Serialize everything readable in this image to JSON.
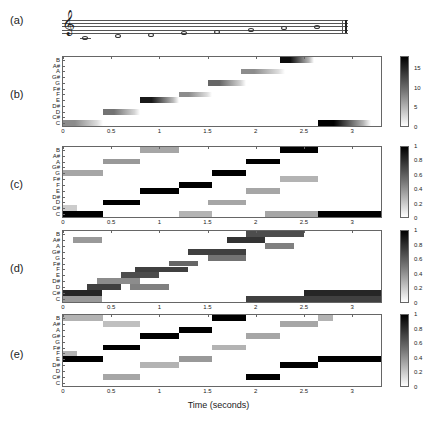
{
  "panel_labels": [
    "(a)",
    "(b)",
    "(c)",
    "(d)",
    "(e)"
  ],
  "xlabel": "Time (seconds)",
  "pitch_labels": [
    "C",
    "C#",
    "D",
    "D#",
    "E",
    "F",
    "F#",
    "G",
    "G#",
    "A",
    "A#",
    "B"
  ],
  "x_ticks": [
    "0",
    "0.5",
    "1",
    "1.5",
    "2",
    "2.5",
    "3"
  ],
  "staff": {
    "clef": "𝄞",
    "notes": [
      "C",
      "D",
      "E",
      "F",
      "G",
      "A",
      "B",
      "C"
    ]
  },
  "chart_data": [
    {
      "panel": "(b)",
      "type": "heatmap",
      "xlabel": "Time (seconds)",
      "xlim": [
        0,
        3.3
      ],
      "colorbar": {
        "ticks": [
          "0",
          "5",
          "10",
          "15"
        ],
        "range": [
          0,
          18
        ]
      },
      "segments": [
        {
          "pitch": 0,
          "start": 0.0,
          "end": 0.42,
          "intensity": 0.45
        },
        {
          "pitch": 2,
          "start": 0.42,
          "end": 0.8,
          "intensity": 0.55
        },
        {
          "pitch": 4,
          "start": 0.8,
          "end": 1.2,
          "intensity": 0.9
        },
        {
          "pitch": 5,
          "start": 1.2,
          "end": 1.55,
          "intensity": 0.45
        },
        {
          "pitch": 7,
          "start": 1.5,
          "end": 1.9,
          "intensity": 0.6
        },
        {
          "pitch": 9,
          "start": 1.85,
          "end": 2.3,
          "intensity": 0.45
        },
        {
          "pitch": 11,
          "start": 2.25,
          "end": 2.6,
          "intensity": 0.95
        },
        {
          "pitch": 0,
          "start": 2.65,
          "end": 3.2,
          "intensity": 1.0
        }
      ]
    },
    {
      "panel": "(c)",
      "type": "heatmap",
      "xlim": [
        0,
        3.3
      ],
      "colorbar": {
        "ticks": [
          "0",
          "0.2",
          "0.4",
          "0.6",
          "0.8",
          "1"
        ],
        "range": [
          0,
          1
        ]
      },
      "segments": [
        {
          "pitch": 0,
          "start": 0.0,
          "end": 0.42,
          "intensity": 1.0
        },
        {
          "pitch": 7,
          "start": 0.0,
          "end": 0.42,
          "intensity": 0.35
        },
        {
          "pitch": 1,
          "start": 0.0,
          "end": 0.15,
          "intensity": 0.2
        },
        {
          "pitch": 2,
          "start": 0.42,
          "end": 0.8,
          "intensity": 1.0
        },
        {
          "pitch": 9,
          "start": 0.42,
          "end": 0.8,
          "intensity": 0.4
        },
        {
          "pitch": 4,
          "start": 0.8,
          "end": 1.2,
          "intensity": 1.0
        },
        {
          "pitch": 11,
          "start": 0.8,
          "end": 1.2,
          "intensity": 0.35
        },
        {
          "pitch": 5,
          "start": 1.2,
          "end": 1.55,
          "intensity": 1.0
        },
        {
          "pitch": 0,
          "start": 1.2,
          "end": 1.55,
          "intensity": 0.3
        },
        {
          "pitch": 7,
          "start": 1.55,
          "end": 1.9,
          "intensity": 1.0
        },
        {
          "pitch": 2,
          "start": 1.5,
          "end": 1.9,
          "intensity": 0.35
        },
        {
          "pitch": 9,
          "start": 1.9,
          "end": 2.25,
          "intensity": 1.0
        },
        {
          "pitch": 4,
          "start": 1.9,
          "end": 2.25,
          "intensity": 0.35
        },
        {
          "pitch": 11,
          "start": 2.25,
          "end": 2.65,
          "intensity": 1.0
        },
        {
          "pitch": 6,
          "start": 2.25,
          "end": 2.65,
          "intensity": 0.3
        },
        {
          "pitch": 0,
          "start": 2.65,
          "end": 3.3,
          "intensity": 1.0
        },
        {
          "pitch": 0,
          "start": 2.1,
          "end": 2.65,
          "intensity": 0.35
        }
      ]
    },
    {
      "panel": "(d)",
      "type": "heatmap",
      "xlim": [
        0,
        3.3
      ],
      "colorbar": {
        "ticks": [
          "0",
          "0.2",
          "0.4",
          "0.6",
          "0.8",
          "1"
        ],
        "range": [
          0,
          1
        ]
      },
      "segments": [
        {
          "pitch": 1,
          "start": 0.0,
          "end": 0.4,
          "intensity": 0.85
        },
        {
          "pitch": 10,
          "start": 0.1,
          "end": 0.4,
          "intensity": 0.4
        },
        {
          "pitch": 0,
          "start": 0.0,
          "end": 0.4,
          "intensity": 0.4
        },
        {
          "pitch": 2,
          "start": 0.25,
          "end": 0.6,
          "intensity": 0.75
        },
        {
          "pitch": 3,
          "start": 0.35,
          "end": 0.8,
          "intensity": 0.45
        },
        {
          "pitch": 4,
          "start": 0.6,
          "end": 1.0,
          "intensity": 0.7
        },
        {
          "pitch": 2,
          "start": 0.7,
          "end": 1.1,
          "intensity": 0.5
        },
        {
          "pitch": 5,
          "start": 0.75,
          "end": 1.3,
          "intensity": 0.75
        },
        {
          "pitch": 6,
          "start": 1.1,
          "end": 1.4,
          "intensity": 0.6
        },
        {
          "pitch": 8,
          "start": 1.3,
          "end": 1.9,
          "intensity": 0.75
        },
        {
          "pitch": 7,
          "start": 1.5,
          "end": 1.9,
          "intensity": 0.55
        },
        {
          "pitch": 10,
          "start": 1.7,
          "end": 2.1,
          "intensity": 0.8
        },
        {
          "pitch": 11,
          "start": 1.9,
          "end": 2.5,
          "intensity": 0.7
        },
        {
          "pitch": 9,
          "start": 2.1,
          "end": 2.4,
          "intensity": 0.5
        },
        {
          "pitch": 1,
          "start": 2.5,
          "end": 3.3,
          "intensity": 0.85
        },
        {
          "pitch": 0,
          "start": 1.9,
          "end": 3.3,
          "intensity": 0.75
        }
      ]
    },
    {
      "panel": "(e)",
      "type": "heatmap",
      "xlim": [
        0,
        3.3
      ],
      "colorbar": {
        "ticks": [
          "0",
          "0.2",
          "0.4",
          "0.6",
          "0.8",
          "1"
        ],
        "range": [
          0,
          1
        ]
      },
      "segments": [
        {
          "pitch": 4,
          "start": 0.0,
          "end": 0.42,
          "intensity": 1.0
        },
        {
          "pitch": 11,
          "start": 0.0,
          "end": 0.42,
          "intensity": 0.3
        },
        {
          "pitch": 5,
          "start": 0.0,
          "end": 0.15,
          "intensity": 0.3
        },
        {
          "pitch": 6,
          "start": 0.42,
          "end": 0.8,
          "intensity": 1.0
        },
        {
          "pitch": 1,
          "start": 0.42,
          "end": 0.8,
          "intensity": 0.35
        },
        {
          "pitch": 10,
          "start": 0.42,
          "end": 0.8,
          "intensity": 0.25
        },
        {
          "pitch": 8,
          "start": 0.8,
          "end": 1.2,
          "intensity": 1.0
        },
        {
          "pitch": 3,
          "start": 0.8,
          "end": 1.2,
          "intensity": 0.3
        },
        {
          "pitch": 9,
          "start": 1.2,
          "end": 1.55,
          "intensity": 1.0
        },
        {
          "pitch": 4,
          "start": 1.2,
          "end": 1.55,
          "intensity": 0.4
        },
        {
          "pitch": 11,
          "start": 1.55,
          "end": 1.9,
          "intensity": 1.0
        },
        {
          "pitch": 6,
          "start": 1.55,
          "end": 1.9,
          "intensity": 0.3
        },
        {
          "pitch": 1,
          "start": 1.9,
          "end": 2.25,
          "intensity": 1.0
        },
        {
          "pitch": 8,
          "start": 1.9,
          "end": 2.25,
          "intensity": 0.35
        },
        {
          "pitch": 3,
          "start": 2.25,
          "end": 2.65,
          "intensity": 1.0
        },
        {
          "pitch": 10,
          "start": 2.25,
          "end": 2.65,
          "intensity": 0.35
        },
        {
          "pitch": 4,
          "start": 2.65,
          "end": 3.3,
          "intensity": 1.0
        },
        {
          "pitch": 11,
          "start": 2.65,
          "end": 2.8,
          "intensity": 0.3
        }
      ]
    }
  ]
}
